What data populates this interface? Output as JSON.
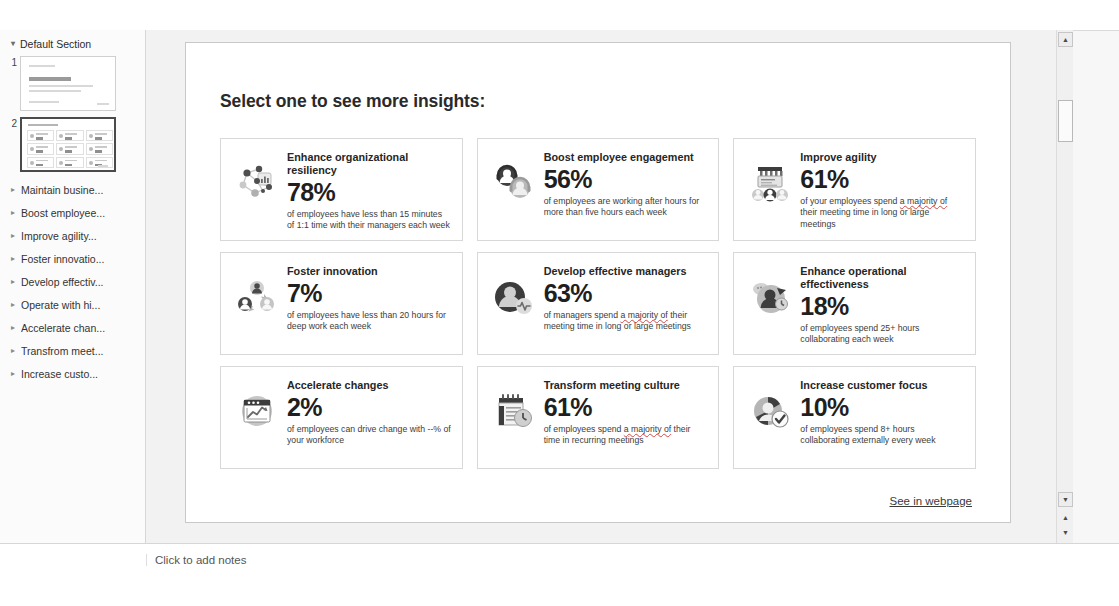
{
  "app": {
    "notes_placeholder": "Click to add notes"
  },
  "thumb_pane": {
    "section": {
      "expand_icon": "triangle-down-icon",
      "label": "Default Section"
    },
    "slides": [
      {
        "number": "1",
        "selected": false
      },
      {
        "number": "2",
        "selected": true
      }
    ],
    "outline_items": [
      {
        "expand_icon": "triangle-right-icon",
        "label": "Maintain busine..."
      },
      {
        "expand_icon": "triangle-right-icon",
        "label": "Boost employee..."
      },
      {
        "expand_icon": "triangle-right-icon",
        "label": "Improve agility..."
      },
      {
        "expand_icon": "triangle-right-icon",
        "label": "Foster innovatio..."
      },
      {
        "expand_icon": "triangle-right-icon",
        "label": "Develop effectiv..."
      },
      {
        "expand_icon": "triangle-right-icon",
        "label": "Operate with hi..."
      },
      {
        "expand_icon": "triangle-right-icon",
        "label": "Accelerate chan..."
      },
      {
        "expand_icon": "triangle-right-icon",
        "label": "Transfrom meet..."
      },
      {
        "expand_icon": "triangle-right-icon",
        "label": "Increase custo..."
      }
    ]
  },
  "slide": {
    "title": "Select one to see more insights:",
    "footer_link": "See in webpage",
    "cards": [
      {
        "icon": "network-nodes-chart-icon",
        "heading": "Enhance organizational resiliency",
        "stat": "78%",
        "desc_pre": "of employees have less than 15 minutes of 1:1 time with their managers each week",
        "desc_mid": "",
        "desc_post": ""
      },
      {
        "icon": "two-people-headset-icon",
        "heading": "Boost employee engagement",
        "stat": "56%",
        "desc_pre": "of employees are working after hours for more than five hours each week",
        "desc_mid": "",
        "desc_post": ""
      },
      {
        "icon": "team-presentation-icon",
        "heading": "Improve agility",
        "stat": "61%",
        "desc_pre": "of your employees spend ",
        "desc_mid": "a majority of",
        "desc_post": " their meeting time in long or large meetings"
      },
      {
        "icon": "three-people-exchange-icon",
        "heading": "Foster innovation",
        "stat": "7%",
        "desc_pre": "of employees have less than 20 hours for deep work each week",
        "desc_mid": "",
        "desc_post": ""
      },
      {
        "icon": "person-pulse-icon",
        "heading": "Develop effective managers",
        "stat": "63%",
        "desc_pre": "of managers spend ",
        "desc_mid": "a majority of",
        "desc_post": " their meeting time in long or large meetings"
      },
      {
        "icon": "person-clock-arrow-icon",
        "heading": "Enhance operational effectiveness",
        "stat": "18%",
        "desc_pre": "of employees spend 25+ hours collaborating each week",
        "desc_mid": "",
        "desc_post": ""
      },
      {
        "icon": "browser-growth-chart-icon",
        "heading": "Accelerate changes",
        "stat": "2%",
        "desc_pre": "of employees can drive change with --%  of your workforce",
        "desc_mid": "",
        "desc_post": ""
      },
      {
        "icon": "calendar-clock-icon",
        "heading": "Transform meeting culture",
        "stat": "61%",
        "desc_pre": "of employees spend ",
        "desc_mid": "a majority of",
        "desc_post": " their time in recurring meetings"
      },
      {
        "icon": "person-check-circle-icon",
        "heading": "Increase customer focus",
        "stat": "10%",
        "desc_pre": "of employees spend 8+ hours collaborating externally every week",
        "desc_mid": "",
        "desc_post": ""
      }
    ]
  },
  "scrollbar": {
    "up_icon": "scroll-up-icon",
    "down_icon": "scroll-down-icon",
    "prev_slide_icon": "previous-slide-icon",
    "next_slide_icon": "next-slide-icon"
  },
  "colors": {
    "page_bg": "#f2f2f2",
    "slide_bg": "#ffffff",
    "card_border": "#d8d8d8",
    "text_dark": "#1f1f1f",
    "text_body": "#3c3c3c",
    "spell_error": "#d04a4a",
    "icon_dark": "#4a4a4a",
    "icon_mid": "#9b9b9b",
    "icon_light": "#cfcfcf"
  }
}
